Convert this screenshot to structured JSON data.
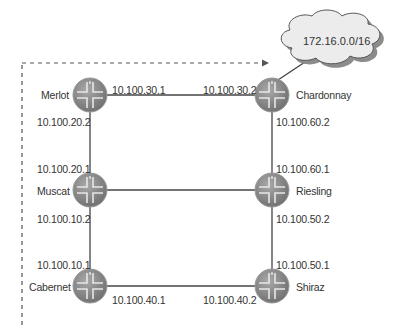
{
  "diagram": {
    "type": "network-topology",
    "cloud": {
      "label": "172.16.0.0/16"
    },
    "routers": [
      {
        "id": "merlot",
        "name": "Merlot"
      },
      {
        "id": "chardonnay",
        "name": "Chardonnay"
      },
      {
        "id": "muscat",
        "name": "Muscat"
      },
      {
        "id": "riesling",
        "name": "Riesling"
      },
      {
        "id": "cabernet",
        "name": "Cabernet"
      },
      {
        "id": "shiraz",
        "name": "Shiraz"
      }
    ],
    "links": [
      {
        "from": "merlot",
        "to": "chardonnay",
        "from_ip": "10.100.30.1",
        "to_ip": "10.100.30.2"
      },
      {
        "from": "merlot",
        "to": "muscat",
        "from_ip": "10.100.20.2",
        "to_ip": "10.100.20.1"
      },
      {
        "from": "chardonnay",
        "to": "riesling",
        "from_ip": "10.100.60.2",
        "to_ip": "10.100.60.1"
      },
      {
        "from": "muscat",
        "to": "riesling"
      },
      {
        "from": "muscat",
        "to": "cabernet",
        "from_ip": "10.100.10.2",
        "to_ip": "10.100.10.1"
      },
      {
        "from": "riesling",
        "to": "shiraz",
        "from_ip": "10.100.50.2",
        "to_ip": "10.100.50.1"
      },
      {
        "from": "cabernet",
        "to": "shiraz",
        "from_ip": "10.100.40.1",
        "to_ip": "10.100.40.2"
      },
      {
        "from": "chardonnay",
        "to": "cloud"
      }
    ],
    "dashed_path": {
      "description": "dashed arrow from bottom-left up and across to cloud"
    },
    "colors": {
      "router": "#8a8a8a",
      "line": "#444444",
      "cloud_fill": "#ececec",
      "cloud_shadow": "#8c8c8c"
    }
  }
}
